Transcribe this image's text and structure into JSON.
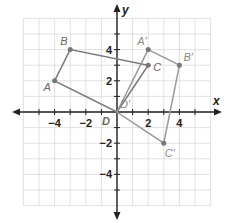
{
  "diagram": {
    "type": "coordinate-plane",
    "grid": {
      "xmin": -6,
      "xmax": 6,
      "ymin": -6,
      "ymax": 6,
      "step": 1
    },
    "axes": {
      "x_label": "x",
      "y_label": "y",
      "x_tick_labels": [
        {
          "value": -4,
          "label": "−4"
        },
        {
          "value": -2,
          "label": "−2"
        },
        {
          "value": 2,
          "label": "2"
        },
        {
          "value": 4,
          "label": "4"
        }
      ],
      "y_tick_labels": [
        {
          "value": 4,
          "label": "4"
        },
        {
          "value": 2,
          "label": "2"
        },
        {
          "value": -2,
          "label": "−2"
        },
        {
          "value": -4,
          "label": "−4"
        }
      ]
    },
    "original_figure": {
      "name": "ABCD",
      "color": "#7a7a7a",
      "vertices": [
        {
          "label": "A",
          "x": -4,
          "y": 2
        },
        {
          "label": "B",
          "x": -3,
          "y": 4
        },
        {
          "label": "C",
          "x": 2,
          "y": 3
        },
        {
          "label": "D",
          "x": 0,
          "y": 0
        }
      ]
    },
    "image_figure": {
      "name": "A'B'C'D'",
      "color": "#9a9a9a",
      "vertices": [
        {
          "label": "A′",
          "x": 2,
          "y": 4
        },
        {
          "label": "B′",
          "x": 4,
          "y": 3
        },
        {
          "label": "C′",
          "x": 3,
          "y": -2
        },
        {
          "label": "D′",
          "x": 0,
          "y": 0
        }
      ]
    }
  }
}
